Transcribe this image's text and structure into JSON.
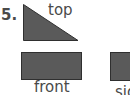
{
  "problem": {
    "number": "5.",
    "views": [
      {
        "name": "top",
        "label": "top",
        "shape": "right-triangle"
      },
      {
        "name": "front",
        "label": "front",
        "shape": "rectangle"
      },
      {
        "name": "side",
        "label": "side",
        "shape": "square"
      }
    ]
  },
  "colors": {
    "shape_fill": "#5a5a5a",
    "shape_stroke": "#2f2f2f",
    "text": "#4a4a4a"
  }
}
